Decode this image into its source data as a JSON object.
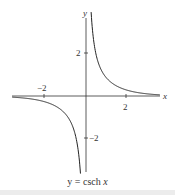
{
  "chart_data": {
    "type": "line",
    "title": "y = csch x",
    "function": "csch x",
    "xlabel": "x",
    "ylabel": "y",
    "x_ticks": [
      -2,
      2
    ],
    "y_ticks": [
      2,
      -2
    ],
    "x_tick_labels": [
      "−2",
      "2"
    ],
    "y_tick_labels": [
      "2",
      "−2"
    ],
    "xlim": [
      -4.0,
      4.3
    ],
    "ylim": [
      -4.0,
      4.3
    ],
    "grid": false,
    "legend": null,
    "series": [
      {
        "name": "csch x (x<0)",
        "x": [
          -4.0,
          -3.0,
          -2.0,
          -1.5,
          -1.0,
          -0.75,
          -0.5,
          -0.35,
          -0.25
        ],
        "y": [
          -0.037,
          -0.1,
          -0.276,
          -0.47,
          -0.851,
          -1.22,
          -1.919,
          -2.78,
          -3.96
        ]
      },
      {
        "name": "csch x (x>0)",
        "x": [
          0.25,
          0.35,
          0.5,
          0.75,
          1.0,
          1.5,
          2.0,
          3.0,
          4.3
        ],
        "y": [
          3.96,
          2.78,
          1.919,
          1.22,
          0.851,
          0.47,
          0.276,
          0.1,
          0.027
        ]
      }
    ],
    "color": "#222222"
  },
  "caption": {
    "prefix": "y = csch ",
    "var": "x"
  },
  "labels": {
    "x_axis": "x",
    "y_axis": "y",
    "xtick_neg2": "−2",
    "xtick_2": "2",
    "ytick_2": "2",
    "ytick_neg2": "−2"
  }
}
